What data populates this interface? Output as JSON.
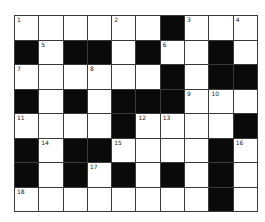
{
  "puzzle": {
    "rows": 8,
    "cols": 10,
    "colors": {
      "black": "#0a0a0a",
      "white": "#ffffff",
      "line": "#3a3a3a"
    },
    "layout": [
      [
        0,
        0,
        0,
        0,
        0,
        0,
        1,
        0,
        0,
        0
      ],
      [
        1,
        0,
        1,
        1,
        0,
        1,
        0,
        0,
        1,
        0
      ],
      [
        0,
        0,
        0,
        0,
        0,
        0,
        1,
        0,
        1,
        1
      ],
      [
        1,
        0,
        1,
        0,
        1,
        1,
        1,
        0,
        0,
        0
      ],
      [
        0,
        0,
        0,
        0,
        1,
        0,
        0,
        0,
        0,
        1
      ],
      [
        1,
        0,
        1,
        1,
        0,
        0,
        0,
        0,
        1,
        0
      ],
      [
        1,
        0,
        1,
        0,
        1,
        0,
        1,
        0,
        1,
        0
      ],
      [
        0,
        0,
        0,
        0,
        0,
        0,
        0,
        0,
        1,
        0
      ]
    ],
    "numbers": [
      {
        "r": 0,
        "c": 0,
        "n": "1"
      },
      {
        "r": 0,
        "c": 4,
        "n": "2"
      },
      {
        "r": 0,
        "c": 7,
        "n": "3"
      },
      {
        "r": 0,
        "c": 9,
        "n": "4"
      },
      {
        "r": 1,
        "c": 1,
        "n": "5"
      },
      {
        "r": 1,
        "c": 6,
        "n": "6"
      },
      {
        "r": 2,
        "c": 0,
        "n": "7"
      },
      {
        "r": 2,
        "c": 3,
        "n": "8"
      },
      {
        "r": 3,
        "c": 7,
        "n": "9"
      },
      {
        "r": 3,
        "c": 8,
        "n": "10"
      },
      {
        "r": 4,
        "c": 0,
        "n": "11"
      },
      {
        "r": 4,
        "c": 5,
        "n": "12"
      },
      {
        "r": 4,
        "c": 6,
        "n": "13"
      },
      {
        "r": 5,
        "c": 1,
        "n": "14"
      },
      {
        "r": 5,
        "c": 4,
        "n": "15"
      },
      {
        "r": 5,
        "c": 9,
        "n": "16"
      },
      {
        "r": 6,
        "c": 3,
        "n": "17"
      },
      {
        "r": 7,
        "c": 0,
        "n": "18"
      }
    ]
  }
}
